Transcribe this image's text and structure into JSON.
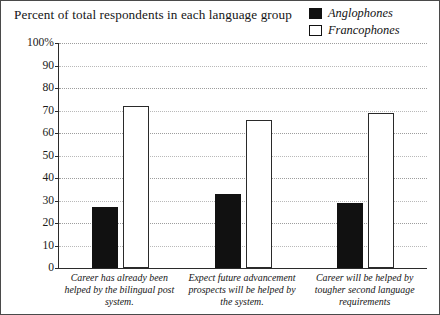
{
  "title": "Percent of total respondents in each language group",
  "legend": {
    "items": [
      {
        "label": "Anglophones",
        "swatch": "filled-black-square",
        "color": "#111111"
      },
      {
        "label": "Francophones",
        "swatch": "hollow-white-square",
        "color": "#ffffff"
      }
    ]
  },
  "axis": {
    "y_ticks": [
      "0",
      "10",
      "20",
      "30",
      "40",
      "50",
      "60",
      "70",
      "80",
      "90",
      "100%"
    ]
  },
  "chart_data": {
    "type": "bar",
    "title": "Percent of total respondents in each language group",
    "xlabel": "",
    "ylabel": "",
    "ylim": [
      0,
      100
    ],
    "yticks": [
      0,
      10,
      20,
      30,
      40,
      50,
      60,
      70,
      80,
      90,
      100
    ],
    "ytick_labels": [
      "0",
      "10",
      "20",
      "30",
      "40",
      "50",
      "60",
      "70",
      "80",
      "90",
      "100%"
    ],
    "grid": true,
    "grid_axis": "y",
    "legend_position": "top-right",
    "categories": [
      "Career has already been helped by the bilingual post system.",
      "Expect future advancement prospects will be helped by the system.",
      "Career will be helped by tougher second language requirements"
    ],
    "series": [
      {
        "name": "Anglophones",
        "color": "#111111",
        "values": [
          27,
          33,
          29
        ]
      },
      {
        "name": "Francophones",
        "color": "#ffffff",
        "values": [
          72,
          66,
          69
        ]
      }
    ]
  }
}
